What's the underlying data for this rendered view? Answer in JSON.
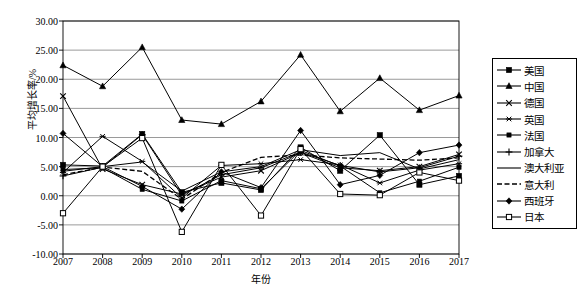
{
  "chart_data": {
    "type": "line",
    "title": "",
    "xlabel": "年份",
    "ylabel": "平均增长率/%",
    "grid": true,
    "legend_position": "right",
    "x": [
      "2007",
      "2008",
      "2009",
      "2010",
      "2011",
      "2012",
      "2013",
      "2014",
      "2015",
      "2016",
      "2017"
    ],
    "categories": [
      "2007",
      "2008",
      "2009",
      "2010",
      "2011",
      "2012",
      "2013",
      "2014",
      "2015",
      "2016",
      "2017"
    ],
    "xlim": [
      2007,
      2017
    ],
    "ylim": [
      -10.0,
      30.0
    ],
    "ytick_labels": [
      "30.00",
      "25.00",
      "20.00",
      "15.00",
      "10.00",
      "5.00",
      "0.00",
      "-5.00",
      "-10.00"
    ],
    "ytick_values": [
      30.0,
      25.0,
      20.0,
      15.0,
      10.0,
      5.0,
      0.0,
      -5.0,
      -10.0
    ],
    "series": [
      {
        "name": "美国",
        "marker": "filled-square",
        "line": "solid",
        "values": [
          5.3,
          5.1,
          10.6,
          0.6,
          2.2,
          1.0,
          8.3,
          4.3,
          10.4,
          1.9,
          3.4
        ]
      },
      {
        "name": "中国",
        "marker": "filled-triangle",
        "line": "solid",
        "values": [
          22.4,
          18.8,
          25.5,
          13.0,
          12.3,
          16.2,
          24.2,
          14.5,
          20.2,
          14.7,
          17.2
        ]
      },
      {
        "name": "德国",
        "marker": "cross-x",
        "line": "solid",
        "values": [
          17.1,
          4.6,
          1.9,
          0.3,
          3.2,
          4.3,
          7.4,
          4.8,
          4.3,
          5.0,
          7.1
        ]
      },
      {
        "name": "英国",
        "marker": "asterisk",
        "line": "solid",
        "values": [
          4.0,
          10.2,
          5.9,
          -0.4,
          5.2,
          5.5,
          6.2,
          5.3,
          2.2,
          4.4,
          5.5
        ]
      },
      {
        "name": "法国",
        "marker": "filled-square-small",
        "line": "solid",
        "values": [
          4.5,
          4.8,
          1.1,
          -0.9,
          2.6,
          1.2,
          7.8,
          5.1,
          0.5,
          2.5,
          4.9
        ]
      },
      {
        "name": "加拿大",
        "marker": "plus",
        "line": "solid",
        "values": [
          3.4,
          4.9,
          10.5,
          0.1,
          3.6,
          4.8,
          7.5,
          5.2,
          4.1,
          4.8,
          6.8
        ]
      },
      {
        "name": "澳大利亚",
        "marker": "none",
        "line": "solid",
        "values": [
          4.2,
          5.0,
          5.8,
          0.8,
          4.1,
          5.0,
          7.9,
          6.9,
          7.4,
          4.6,
          6.2
        ]
      },
      {
        "name": "意大利",
        "marker": "none",
        "line": "dashed",
        "values": [
          3.6,
          4.9,
          4.2,
          -0.6,
          4.0,
          6.6,
          7.0,
          6.5,
          6.3,
          6.1,
          6.5
        ]
      },
      {
        "name": "西班牙",
        "marker": "filled-diamond",
        "line": "solid",
        "values": [
          10.7,
          5.0,
          1.6,
          -2.3,
          4.1,
          1.4,
          11.2,
          1.9,
          3.5,
          7.4,
          8.7
        ]
      },
      {
        "name": "日本",
        "marker": "open-square",
        "line": "solid",
        "values": [
          -3.0,
          5.0,
          9.9,
          -6.2,
          5.3,
          -3.4,
          8.0,
          0.3,
          0.1,
          4.0,
          2.6
        ]
      }
    ]
  },
  "axis": {
    "y_title": "平均增长率/%",
    "x_title": "年份"
  }
}
